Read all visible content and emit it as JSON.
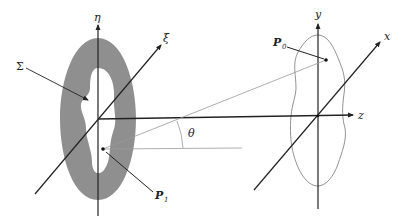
{
  "diagram": {
    "left_frame": {
      "vertical_axis_label": "η",
      "oblique_axis_label": "ξ",
      "aperture_label": "Σ",
      "point_label": "P",
      "point_subscript": "1"
    },
    "right_frame": {
      "vertical_axis_label": "y",
      "oblique_axis_label": "x",
      "horizontal_axis_label": "z",
      "point_label": "P",
      "point_subscript": "0"
    },
    "angle_label": "θ",
    "colors": {
      "aperture_fill": "#8f8f8f",
      "axis_stroke": "#222222",
      "ray_stroke": "#999999",
      "outline_stroke": "#777777",
      "background": "#ffffff"
    }
  }
}
